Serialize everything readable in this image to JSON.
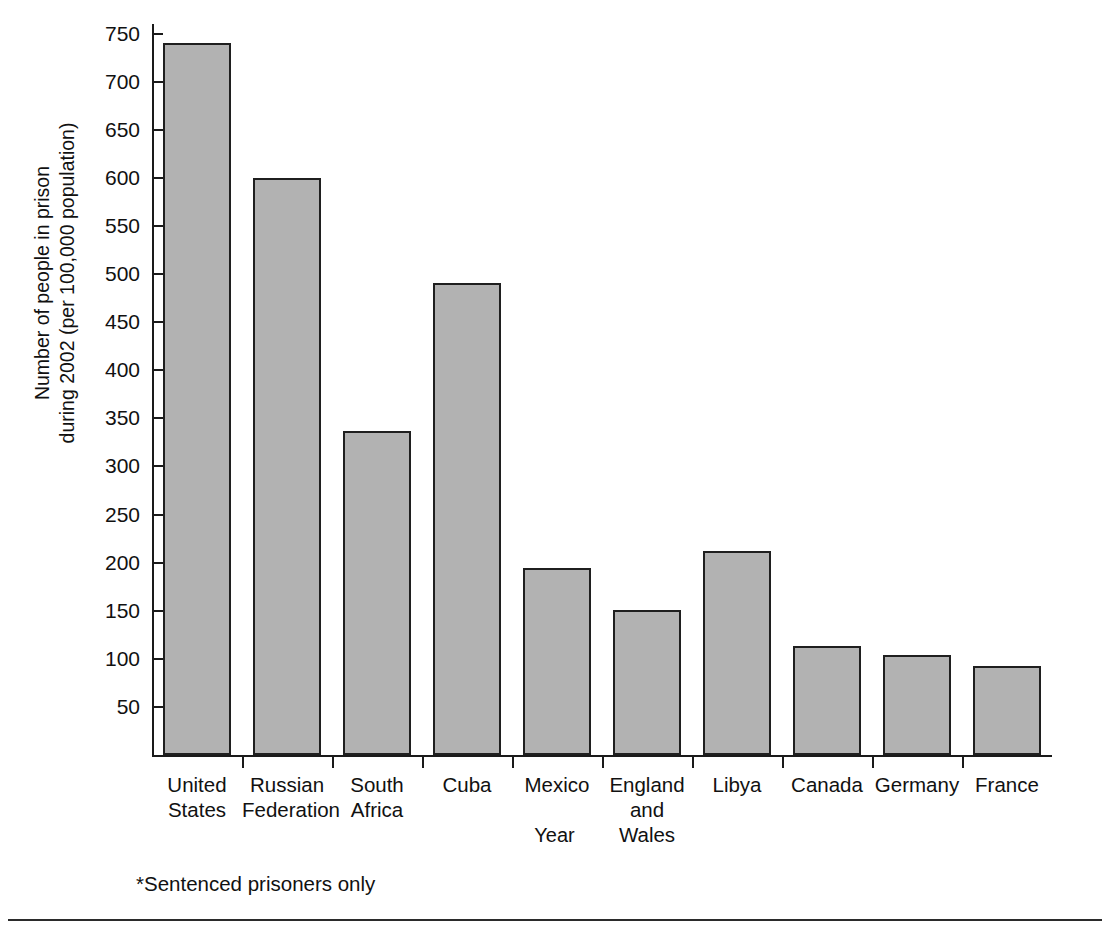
{
  "chart_data": {
    "type": "bar",
    "title": "",
    "xlabel": "Year",
    "ylabel": "Number of people in prison\nduring 2002 (per 100,000 population)",
    "ylim": [
      0,
      760
    ],
    "ytick_step": 50,
    "yticks": [
      750,
      700,
      650,
      600,
      550,
      500,
      450,
      400,
      350,
      300,
      250,
      200,
      150,
      100,
      50
    ],
    "grid": false,
    "legend": null,
    "bar_color": "#b2b2b2",
    "bar_edge_color": "#1f1f1f",
    "categories": [
      "United\nStates",
      "Russian\nFederation",
      "South\nAfrica",
      "Cuba",
      "Mexico",
      "England\nand\nWales",
      "Libya",
      "Canada",
      "Germany",
      "France"
    ],
    "values": [
      740,
      600,
      337,
      491,
      194,
      151,
      212,
      113,
      104,
      93
    ],
    "annotations": [
      "*Sentenced prisoners only"
    ]
  },
  "axes": {
    "y_title": "Number of people in prison\nduring 2002 (per 100,000 population)",
    "x_title": "Year"
  },
  "footnote": "*Sentenced prisoners only",
  "scan_artifact": "",
  "colors": {
    "bar_fill": "#b2b2b2",
    "bar_edge": "#1f1f1f",
    "axis": "#1a1a1a",
    "text": "#111111",
    "rule": "#2b2b2b",
    "background": "#ffffff"
  }
}
